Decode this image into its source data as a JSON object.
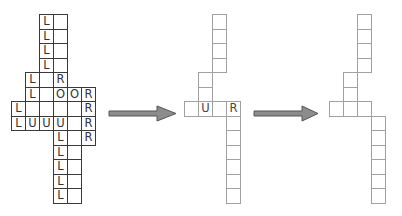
{
  "diagram": {
    "cell_width": 14,
    "cell_height": 14.5,
    "colors": {
      "grid1_border": "#3a3a3a",
      "grid_light_border": "#a0a0a0",
      "arrow_fill": "#8c8c8c",
      "arrow_stroke": "#555555",
      "text": "#333333"
    },
    "grids": [
      {
        "name": "grid-1",
        "origin": [
          11,
          14
        ],
        "cells": [
          {
            "c": 2,
            "r": 0,
            "t": "L"
          },
          {
            "c": 3,
            "r": 0,
            "t": ""
          },
          {
            "c": 2,
            "r": 1,
            "t": "L"
          },
          {
            "c": 3,
            "r": 1,
            "t": ""
          },
          {
            "c": 2,
            "r": 2,
            "t": "L"
          },
          {
            "c": 3,
            "r": 2,
            "t": ""
          },
          {
            "c": 2,
            "r": 3,
            "t": "L"
          },
          {
            "c": 3,
            "r": 3,
            "t": ""
          },
          {
            "c": 1,
            "r": 4,
            "t": "L"
          },
          {
            "c": 2,
            "r": 4,
            "t": ""
          },
          {
            "c": 3,
            "r": 4,
            "t": "R"
          },
          {
            "c": 1,
            "r": 5,
            "t": "L"
          },
          {
            "c": 2,
            "r": 5,
            "t": ""
          },
          {
            "c": 3,
            "r": 5,
            "t": "O"
          },
          {
            "c": 4,
            "r": 5,
            "t": "O"
          },
          {
            "c": 5,
            "r": 5,
            "t": "R"
          },
          {
            "c": 0,
            "r": 6,
            "t": "L"
          },
          {
            "c": 1,
            "r": 6,
            "t": ""
          },
          {
            "c": 2,
            "r": 6,
            "t": ""
          },
          {
            "c": 3,
            "r": 6,
            "t": ""
          },
          {
            "c": 4,
            "r": 6,
            "t": ""
          },
          {
            "c": 5,
            "r": 6,
            "t": "R"
          },
          {
            "c": 0,
            "r": 7,
            "t": "L"
          },
          {
            "c": 1,
            "r": 7,
            "t": "U"
          },
          {
            "c": 2,
            "r": 7,
            "t": "U"
          },
          {
            "c": 3,
            "r": 7,
            "t": "U"
          },
          {
            "c": 4,
            "r": 7,
            "t": ""
          },
          {
            "c": 5,
            "r": 7,
            "t": "R"
          },
          {
            "c": 3,
            "r": 8,
            "t": "L"
          },
          {
            "c": 4,
            "r": 8,
            "t": ""
          },
          {
            "c": 5,
            "r": 8,
            "t": "R"
          },
          {
            "c": 3,
            "r": 9,
            "t": "L"
          },
          {
            "c": 4,
            "r": 9,
            "t": ""
          },
          {
            "c": 3,
            "r": 10,
            "t": "L"
          },
          {
            "c": 4,
            "r": 10,
            "t": ""
          },
          {
            "c": 3,
            "r": 11,
            "t": "L"
          },
          {
            "c": 4,
            "r": 11,
            "t": ""
          },
          {
            "c": 3,
            "r": 12,
            "t": "L"
          },
          {
            "c": 4,
            "r": 12,
            "t": ""
          }
        ]
      },
      {
        "name": "grid-2",
        "origin": [
          184,
          14
        ],
        "cells": [
          {
            "c": 2,
            "r": 0,
            "t": ""
          },
          {
            "c": 2,
            "r": 1,
            "t": ""
          },
          {
            "c": 2,
            "r": 2,
            "t": ""
          },
          {
            "c": 2,
            "r": 3,
            "t": ""
          },
          {
            "c": 1,
            "r": 4,
            "t": ""
          },
          {
            "c": 1,
            "r": 5,
            "t": ""
          },
          {
            "c": 0,
            "r": 6,
            "t": ""
          },
          {
            "c": 1,
            "r": 6,
            "t": "U"
          },
          {
            "c": 2,
            "r": 6,
            "t": ""
          },
          {
            "c": 3,
            "r": 6,
            "t": "R"
          },
          {
            "c": 3,
            "r": 7,
            "t": ""
          },
          {
            "c": 3,
            "r": 8,
            "t": ""
          },
          {
            "c": 3,
            "r": 9,
            "t": ""
          },
          {
            "c": 3,
            "r": 10,
            "t": ""
          },
          {
            "c": 3,
            "r": 11,
            "t": ""
          },
          {
            "c": 3,
            "r": 12,
            "t": ""
          }
        ]
      },
      {
        "name": "grid-3",
        "origin": [
          329,
          14
        ],
        "cells": [
          {
            "c": 2,
            "r": 0,
            "t": ""
          },
          {
            "c": 2,
            "r": 1,
            "t": ""
          },
          {
            "c": 2,
            "r": 2,
            "t": ""
          },
          {
            "c": 2,
            "r": 3,
            "t": ""
          },
          {
            "c": 1,
            "r": 4,
            "t": ""
          },
          {
            "c": 1,
            "r": 5,
            "t": ""
          },
          {
            "c": 0,
            "r": 6,
            "t": ""
          },
          {
            "c": 1,
            "r": 6,
            "t": ""
          },
          {
            "c": 2,
            "r": 6,
            "t": ""
          },
          {
            "c": 3,
            "r": 7,
            "t": ""
          },
          {
            "c": 3,
            "r": 8,
            "t": ""
          },
          {
            "c": 3,
            "r": 9,
            "t": ""
          },
          {
            "c": 3,
            "r": 10,
            "t": ""
          },
          {
            "c": 3,
            "r": 11,
            "t": ""
          },
          {
            "c": 3,
            "r": 12,
            "t": ""
          }
        ]
      }
    ],
    "arrows": [
      {
        "name": "arrow-1",
        "x_start": 109,
        "x_head": 157,
        "x_tip": 176,
        "y_center": 113.5
      },
      {
        "name": "arrow-2",
        "x_start": 254,
        "x_head": 302,
        "x_tip": 318,
        "y_center": 113.5
      }
    ]
  }
}
